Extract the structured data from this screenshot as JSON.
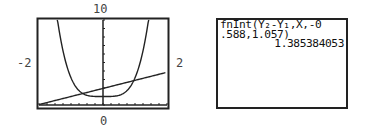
{
  "graph": {
    "window": {
      "ymax_label": "10",
      "ymin_label": "0",
      "xmin_label": "-2",
      "xmax_label": "2"
    }
  },
  "home_screen": {
    "lines": [
      "fnInt(Y₂-Y₁,X,-0",
      ".588,1.057)"
    ],
    "result": "1.385384053"
  },
  "chart_data": {
    "type": "line",
    "title": "",
    "xlabel": "",
    "ylabel": "",
    "xlim": [
      -2,
      2
    ],
    "ylim": [
      0,
      10
    ],
    "x_tick_step": 0.25,
    "y_tick_step": 1,
    "grid": false,
    "series": [
      {
        "name": "Y1",
        "equation": "approx 2.2x^4 + 1",
        "x": [
          -1.42,
          -1.25,
          -1.0,
          -0.75,
          -0.588,
          -0.5,
          -0.25,
          0,
          0.25,
          0.5,
          0.75,
          1.0,
          1.057,
          1.25,
          1.42
        ],
        "y": [
          10.0,
          6.37,
          3.2,
          1.7,
          1.26,
          1.14,
          1.01,
          1.0,
          1.01,
          1.14,
          1.7,
          3.2,
          3.75,
          6.37,
          10.0
        ]
      },
      {
        "name": "Y2",
        "equation": "approx x + 2",
        "x": [
          -2,
          -0.588,
          0,
          1.057,
          2
        ],
        "y": [
          0,
          1.41,
          2.0,
          3.06,
          4.0
        ]
      }
    ],
    "annotations": [
      {
        "text": "fnInt(Y2-Y1,X,-0.588,1.057) = 1.385384053"
      }
    ]
  }
}
